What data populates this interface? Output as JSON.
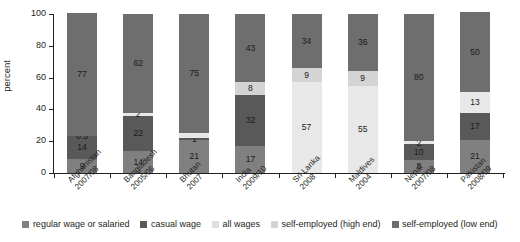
{
  "chart_data": {
    "type": "bar",
    "subtype": "stacked-bar",
    "title": "",
    "xlabel": "",
    "ylabel": "percent",
    "ylim": [
      0,
      100
    ],
    "yticks": [
      0,
      20,
      40,
      60,
      80,
      100
    ],
    "grid": false,
    "legend_position": "bottom",
    "categories": [
      "Afghanistan 2007/08",
      "Bangladesh 2005/06",
      "Bhutan 2007",
      "India 2009/10",
      "Sri Lanka 2008",
      "Maldives 2004",
      "Nepal 2007/08",
      "Pakistan 2008/09"
    ],
    "category_lines": [
      [
        "Afghanistan",
        "2007/08"
      ],
      [
        "Bangladesh",
        "2005/06"
      ],
      [
        "Bhutan",
        "2007"
      ],
      [
        "India",
        "2009/10"
      ],
      [
        "Sri Lanka",
        "2008"
      ],
      [
        "Maldives",
        "2004"
      ],
      [
        "Nepal",
        "2007/08"
      ],
      [
        "Pakistan",
        "2008/09"
      ]
    ],
    "series": [
      {
        "name": "regular wage or salaried",
        "color": "#808080",
        "values": [
          9,
          14,
          21,
          17,
          null,
          null,
          8,
          21
        ]
      },
      {
        "name": "casual wage",
        "color": "#595959",
        "values": [
          14,
          22,
          1,
          32,
          null,
          null,
          10,
          17
        ]
      },
      {
        "name": "all wages",
        "color": "#e8e8e8",
        "values": [
          0.5,
          2,
          null,
          null,
          57,
          55,
          2,
          13
        ]
      },
      {
        "name": "self-employed (high end)",
        "color": "#d4d4d4",
        "values": [
          null,
          null,
          null,
          8,
          9,
          9,
          null,
          null
        ]
      },
      {
        "name": "self-employed (low end)",
        "color": "#6e6e6e",
        "values": [
          77,
          62,
          75,
          43,
          34,
          36,
          80,
          50
        ]
      }
    ],
    "bars": [
      {
        "category": "Afghanistan 2007/08",
        "segments": [
          {
            "series": "regular wage or salaried",
            "value": 9,
            "label": "9"
          },
          {
            "series": "casual wage",
            "value": 14,
            "label": "14"
          },
          {
            "series": "all wages",
            "value": 0.5,
            "label": "0.5"
          },
          {
            "series": "self-employed (low end)",
            "value": 77,
            "label": "77"
          }
        ]
      },
      {
        "category": "Bangladesh 2005/06",
        "segments": [
          {
            "series": "regular wage or salaried",
            "value": 14,
            "label": "14"
          },
          {
            "series": "casual wage",
            "value": 22,
            "label": "22"
          },
          {
            "series": "all wages",
            "value": 2,
            "label": "2"
          },
          {
            "series": "self-employed (low end)",
            "value": 62,
            "label": "62"
          }
        ]
      },
      {
        "category": "Bhutan 2007",
        "segments": [
          {
            "series": "regular wage or salaried",
            "value": 21,
            "label": "21"
          },
          {
            "series": "casual wage",
            "value": 1,
            "label": "1"
          },
          {
            "series": "all wages",
            "value": 3,
            "label": ""
          },
          {
            "series": "self-employed (low end)",
            "value": 75,
            "label": "75"
          }
        ]
      },
      {
        "category": "India 2009/10",
        "segments": [
          {
            "series": "regular wage or salaried",
            "value": 17,
            "label": "17"
          },
          {
            "series": "casual wage",
            "value": 32,
            "label": "32"
          },
          {
            "series": "self-employed (high end)",
            "value": 8,
            "label": "8"
          },
          {
            "series": "self-employed (low end)",
            "value": 43,
            "label": "43"
          }
        ]
      },
      {
        "category": "Sri Lanka 2008",
        "segments": [
          {
            "series": "all wages",
            "value": 57,
            "label": "57"
          },
          {
            "series": "self-employed (high end)",
            "value": 9,
            "label": "9"
          },
          {
            "series": "self-employed (low end)",
            "value": 34,
            "label": "34"
          }
        ]
      },
      {
        "category": "Maldives 2004",
        "segments": [
          {
            "series": "all wages",
            "value": 55,
            "label": "55"
          },
          {
            "series": "self-employed (high end)",
            "value": 9,
            "label": "9"
          },
          {
            "series": "self-employed (low end)",
            "value": 36,
            "label": "36"
          }
        ]
      },
      {
        "category": "Nepal 2007/08",
        "segments": [
          {
            "series": "regular wage or salaried",
            "value": 8,
            "label": "8"
          },
          {
            "series": "casual wage",
            "value": 10,
            "label": "10"
          },
          {
            "series": "all wages",
            "value": 2,
            "label": "2"
          },
          {
            "series": "self-employed (low end)",
            "value": 80,
            "label": "80"
          }
        ]
      },
      {
        "category": "Pakistan 2008/09",
        "segments": [
          {
            "series": "regular wage or salaried",
            "value": 21,
            "label": "21"
          },
          {
            "series": "casual wage",
            "value": 17,
            "label": "17"
          },
          {
            "series": "all wages",
            "value": 13,
            "label": "13"
          },
          {
            "series": "self-employed (low end)",
            "value": 50,
            "label": "50"
          }
        ]
      }
    ],
    "legend": [
      {
        "label": "regular wage or salaried",
        "color": "#808080"
      },
      {
        "label": "casual wage",
        "color": "#595959"
      },
      {
        "label": "all wages",
        "color": "#e0e0e0"
      },
      {
        "label": "self-employed (high end)",
        "color": "#d4d4d4"
      },
      {
        "label": "self-employed (low end)",
        "color": "#6e6e6e"
      }
    ]
  },
  "colors": {
    "axis": "#231f20",
    "background": "#ffffff",
    "text": "#231f20"
  }
}
